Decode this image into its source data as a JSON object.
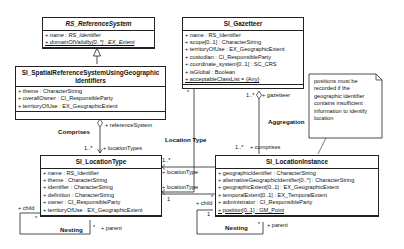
{
  "classes": {
    "rs_reference_system": {
      "name": "RS_ReferenceSystem",
      "attributes": [
        "+ name : RS_Identifier",
        "+ domainOfValidity[0..*] : EX_Extent"
      ]
    },
    "si_srs_geo": {
      "name_line1": "SI_SpatialReferenceSystemUsingGeographic",
      "name_line2": "Identifiers",
      "attributes": [
        "+ theme : CharacterString",
        "+ overallOwner : CI_ResponsibleParty",
        "+ territoryOfUse : EX_GeographicExtent"
      ]
    },
    "si_gazetteer": {
      "name": "SI_Gazetteer",
      "attributes": [
        "+ name : RS_Identifier",
        "+ scope[0..1] : CharacterString",
        "+ territoryOfUse : EX_GeographicExtent",
        "+ custodian : CI_ResponsibleParty",
        "+ coordinate_system[0..1] : SC_CRS",
        "+ isGlobal : Boolean",
        "+ acceptableClassList = {Any}"
      ]
    },
    "si_location_type": {
      "name": "SI_LocationType",
      "attributes": [
        "+ name : RS_Identifier",
        "+ theme : CharacterString",
        "+ identifier : CharacterString",
        "+ definition : CharacterString",
        "+ owner : CI_ResponsibleParty",
        "+ territoryOfUse : EX_GeographicExtent"
      ]
    },
    "si_location_instance": {
      "name": "SI_LocationInstance",
      "attributes": [
        "+ geographicIdentifier : CharacterString",
        "+ alternativeGeographicIdentifier[0..*] : CharacterString",
        "+ geographicExtent[0..1] : EX_GeographicExtent",
        "+ temporalExtent[0..1] : EX_TemporalExtent",
        "+ administrator : CI_ResponsibleParty",
        "+ position[0..1] : GM_Point"
      ]
    }
  },
  "note": {
    "text": "positions must be recorded if the geographic identifier contains insufficient information to identify location"
  },
  "associations": {
    "comprises": {
      "name": "Comprises",
      "end_a": "+ referenceSystem",
      "end_b": "+ locationTypes",
      "mult_b": "1..*"
    },
    "location_type": {
      "name": "Location Type",
      "mult_top": "1..*",
      "end_a": "+ locationType",
      "end_b": "+ locationType",
      "mult_b": "1"
    },
    "aggregation": {
      "name": "Aggregation",
      "end_a": "+ gazetteer",
      "mult_a": "1..*",
      "end_b": "+ comprises",
      "mult_b": "1..*",
      "gaz_mult": "*"
    },
    "nesting_type": {
      "name": "Nesting",
      "child": "+ child",
      "parent": "+ parent",
      "mult_child": "*",
      "mult_parent": "*"
    },
    "nesting_instance": {
      "name": "Nesting",
      "child": "+ child",
      "parent": "+ parent",
      "mult_child": "*",
      "mult_parent": "*",
      "mult_one": "1"
    }
  }
}
